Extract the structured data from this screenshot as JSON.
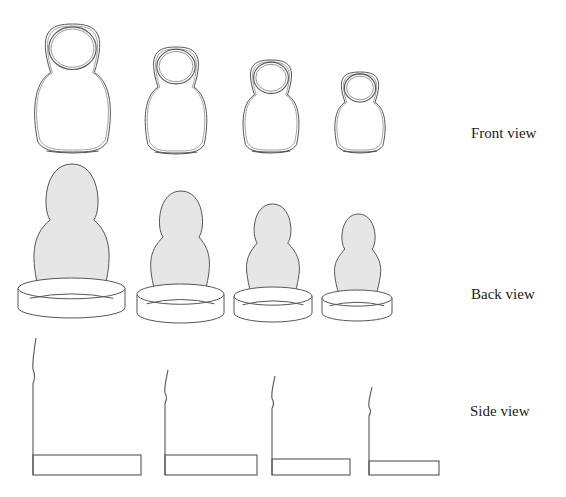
{
  "diagram": {
    "row_labels": {
      "front": "Front view",
      "back": "Back view",
      "side": "Side view"
    },
    "colors": {
      "stroke": "#555555",
      "stroke_light": "#8a8a8a",
      "fill_back": "#e6e6e6",
      "background": "#ffffff",
      "text": "#1a1a1a"
    },
    "dolls": [
      {
        "id": 1,
        "front": {
          "x1": 33,
          "x2": 112,
          "top": 24,
          "bottom": 152
        },
        "back": {
          "head_top": 164,
          "head_x1": 44,
          "head_x2": 100,
          "body_x1": 33,
          "body_x2": 110,
          "base_x1": 18,
          "base_x2": 125,
          "base_top": 278,
          "base_bottom": 318
        },
        "side": {
          "line_top": 338,
          "rect_x1": 33,
          "rect_x2": 141,
          "rect_top": 455,
          "rect_bottom": 475
        }
      },
      {
        "id": 2,
        "front": {
          "x1": 144,
          "x2": 208,
          "top": 47,
          "bottom": 153
        },
        "back": {
          "head_top": 191,
          "head_x1": 158,
          "head_x2": 204,
          "body_x1": 150,
          "body_x2": 210,
          "base_x1": 137,
          "base_x2": 224,
          "base_top": 284,
          "base_bottom": 323
        },
        "side": {
          "line_top": 370,
          "rect_x1": 165,
          "rect_x2": 257,
          "rect_top": 455,
          "rect_bottom": 475
        }
      },
      {
        "id": 3,
        "front": {
          "x1": 242,
          "x2": 300,
          "top": 60,
          "bottom": 152
        },
        "back": {
          "head_top": 204,
          "head_x1": 253,
          "head_x2": 292,
          "body_x1": 246,
          "body_x2": 300,
          "base_x1": 234,
          "base_x2": 312,
          "base_top": 287,
          "base_bottom": 322
        },
        "side": {
          "line_top": 376,
          "rect_x1": 272,
          "rect_x2": 350,
          "rect_top": 459,
          "rect_bottom": 475
        }
      },
      {
        "id": 4,
        "front": {
          "x1": 334,
          "x2": 386,
          "top": 72,
          "bottom": 152
        },
        "back": {
          "head_top": 214,
          "head_x1": 341,
          "head_x2": 376,
          "body_x1": 334,
          "body_x2": 381,
          "base_x1": 322,
          "base_x2": 392,
          "base_top": 290,
          "base_bottom": 321
        },
        "side": {
          "line_top": 387,
          "rect_x1": 369,
          "rect_x2": 439,
          "rect_top": 461,
          "rect_bottom": 475
        }
      }
    ]
  }
}
